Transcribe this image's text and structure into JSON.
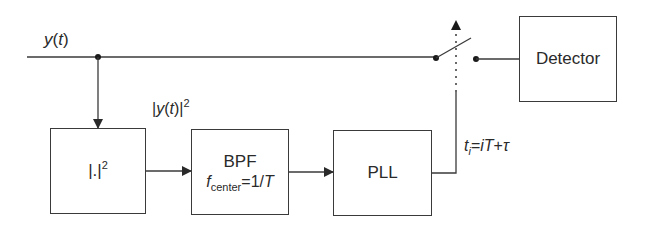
{
  "diagram": {
    "input_signal": {
      "base": "y",
      "arg": "(",
      "var": "t",
      "close": ")"
    },
    "squared_signal": {
      "open": "|",
      "base": "y",
      "paren_open": "(",
      "var": "t",
      "paren_close": ")|",
      "exp": "2"
    },
    "blocks": {
      "squarer": {
        "label": "|.|",
        "exp": "2"
      },
      "bpf": {
        "title": "BPF",
        "f": "f",
        "sub": "center",
        "eq": "=1/",
        "T": "T"
      },
      "pll": {
        "label": "PLL"
      },
      "detector": {
        "label": "Detector"
      }
    },
    "timing_label": {
      "t": "t",
      "sub": "i",
      "eq": "=",
      "i": "i",
      "T": "T",
      "plus": "+",
      "tau": "τ"
    },
    "colors": {
      "line": "#3a3a3a",
      "text": "#2a2a2a",
      "background": "#ffffff"
    }
  }
}
